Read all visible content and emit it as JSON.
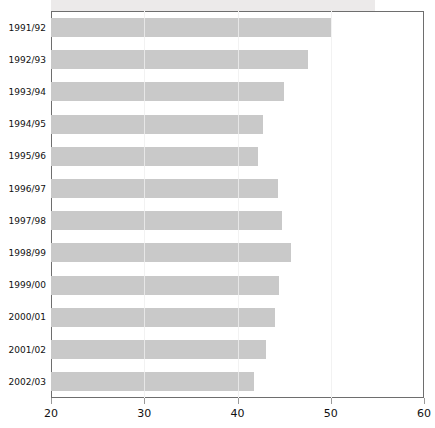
{
  "chart": {
    "type": "bar",
    "orientation": "horizontal",
    "title": "",
    "subtitle": "",
    "xlabel": "",
    "ylabel": "",
    "bar_color": "#c9c9c9",
    "axis_color": "#6e6e6e",
    "grid_color": "#e3e3e3",
    "text_color": "#111111"
  },
  "chart_data": {
    "type": "bar",
    "orientation": "horizontal",
    "title": "",
    "xlabel": "",
    "ylabel": "",
    "xlim": [
      20,
      60
    ],
    "grid": true,
    "legend": null,
    "categories": [
      "1991/92",
      "1992/93",
      "1993/94",
      "1994/95",
      "1995/96",
      "1996/97",
      "1997/98",
      "1998/99",
      "1999/00",
      "2000/01",
      "2001/02",
      "2002/03"
    ],
    "values": [
      50.0,
      47.6,
      45.0,
      42.7,
      42.2,
      44.3,
      44.8,
      45.7,
      44.5,
      44.0,
      43.1,
      41.8
    ],
    "xticks": [
      20,
      30,
      40,
      50,
      60
    ],
    "xtick_labels": [
      "20",
      "30",
      "40",
      "50",
      "60"
    ]
  }
}
